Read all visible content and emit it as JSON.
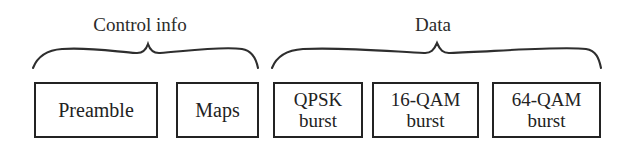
{
  "diagram": {
    "background_color": "#ffffff",
    "line_color": "#232323",
    "text_color": "#222222",
    "groups": [
      {
        "name": "control-info",
        "label": "Control info",
        "brace_icon": "curly-brace-horizontal-icon"
      },
      {
        "name": "data",
        "label": "Data",
        "brace_icon": "curly-brace-horizontal-icon"
      }
    ],
    "segments": [
      {
        "name": "preamble",
        "line1": "Preamble",
        "line2": ""
      },
      {
        "name": "maps",
        "line1": "Maps",
        "line2": ""
      },
      {
        "name": "qpsk-burst",
        "line1": "QPSK",
        "line2": "burst"
      },
      {
        "name": "16-qam-burst",
        "line1": "16-QAM",
        "line2": "burst"
      },
      {
        "name": "64-qam-burst",
        "line1": "64-QAM",
        "line2": "burst"
      }
    ]
  }
}
